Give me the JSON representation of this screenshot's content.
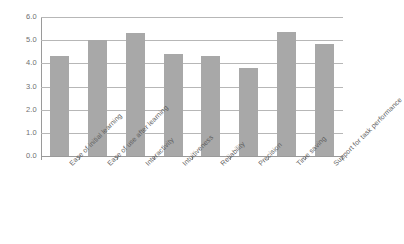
{
  "chart_data": {
    "type": "bar",
    "title": "",
    "subtitle": "",
    "xlabel": "",
    "ylabel": "",
    "ylim": [
      0.0,
      6.0
    ],
    "ytick_step": 1.0,
    "ytick_labels": [
      "0.0",
      "1.0",
      "2.0",
      "3.0",
      "4.0",
      "5.0",
      "6.0"
    ],
    "ytick_values": [
      0.0,
      1.0,
      2.0,
      3.0,
      4.0,
      5.0,
      6.0
    ],
    "grid": true,
    "grid_axis": "y",
    "legend": false,
    "legend_position": "none",
    "bar_color": "#a8a8a8",
    "gridline_color": "#b7b7b7",
    "axis_color": "#9a9a9a",
    "tick_label_color": "#6f6f6f",
    "category_label_color": "#5f5f5f",
    "category_label_rotation": -45,
    "categories": [
      "Ease of initial learning",
      "Ease of use after learning",
      "Interactivity",
      "Intuitiveness",
      "Reliability",
      "Precision",
      "Time saving",
      "Support for task performance"
    ],
    "values": [
      4.3,
      5.0,
      5.3,
      4.4,
      4.3,
      3.8,
      5.35,
      4.85
    ]
  }
}
